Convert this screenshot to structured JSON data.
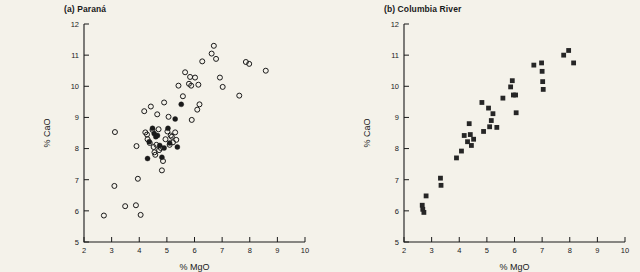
{
  "figure": {
    "background_color": "#f4f2ea",
    "marker_color": "#1a1a1a",
    "axis_color": "#1a1a1a"
  },
  "chart_data": [
    {
      "type": "scatter",
      "title": "(a) Paraná",
      "panel_label": "(a)",
      "panel_name": "Paraná",
      "xlabel": "% MgO",
      "ylabel": "% CaO",
      "xlim": [
        2,
        10
      ],
      "ylim": [
        5,
        12
      ],
      "xticks": [
        2,
        3,
        4,
        5,
        6,
        7,
        8,
        9,
        10
      ],
      "xtick_labels": [
        "2",
        "3",
        "4",
        "5",
        "6",
        "7",
        "8",
        "9",
        "10"
      ],
      "yticks": [
        5,
        6,
        7,
        8,
        9,
        10,
        11,
        12
      ],
      "ytick_labels": [
        "5",
        "6",
        "7",
        "8",
        "9",
        "10",
        "11",
        "12"
      ],
      "grid": false,
      "legend": null,
      "series": [
        {
          "name": "open-circles",
          "marker": "open-circle",
          "points": [
            [
              2.72,
              5.85
            ],
            [
              3.12,
              8.53
            ],
            [
              3.1,
              6.8
            ],
            [
              3.49,
              6.15
            ],
            [
              3.88,
              6.18
            ],
            [
              3.9,
              8.08
            ],
            [
              3.95,
              7.03
            ],
            [
              4.05,
              5.87
            ],
            [
              4.18,
              9.2
            ],
            [
              4.22,
              8.52
            ],
            [
              4.28,
              8.45
            ],
            [
              4.3,
              8.3
            ],
            [
              4.38,
              8.18
            ],
            [
              4.42,
              9.35
            ],
            [
              4.48,
              8.6
            ],
            [
              4.52,
              8.05
            ],
            [
              4.55,
              7.88
            ],
            [
              4.58,
              7.8
            ],
            [
              4.62,
              8.12
            ],
            [
              4.65,
              9.1
            ],
            [
              4.7,
              8.62
            ],
            [
              4.72,
              7.95
            ],
            [
              4.78,
              8.02
            ],
            [
              4.82,
              7.3
            ],
            [
              4.86,
              7.6
            ],
            [
              4.9,
              9.48
            ],
            [
              4.95,
              8.3
            ],
            [
              5.02,
              8.55
            ],
            [
              5.06,
              9.02
            ],
            [
              5.1,
              8.12
            ],
            [
              5.14,
              8.42
            ],
            [
              5.18,
              8.38
            ],
            [
              5.22,
              8.2
            ],
            [
              5.3,
              8.52
            ],
            [
              5.34,
              8.28
            ],
            [
              5.42,
              10.02
            ],
            [
              5.58,
              9.68
            ],
            [
              5.66,
              10.45
            ],
            [
              5.8,
              10.08
            ],
            [
              5.84,
              10.3
            ],
            [
              5.88,
              10.02
            ],
            [
              5.9,
              8.92
            ],
            [
              6.02,
              10.28
            ],
            [
              6.1,
              9.25
            ],
            [
              6.14,
              10.05
            ],
            [
              6.18,
              9.42
            ],
            [
              6.28,
              10.8
            ],
            [
              6.62,
              11.05
            ],
            [
              6.7,
              11.3
            ],
            [
              6.78,
              10.88
            ],
            [
              6.92,
              10.28
            ],
            [
              7.02,
              9.98
            ],
            [
              7.62,
              9.7
            ],
            [
              7.86,
              10.78
            ],
            [
              7.98,
              10.72
            ],
            [
              8.58,
              10.5
            ]
          ]
        },
        {
          "name": "filled-circles",
          "marker": "filled-circle",
          "points": [
            [
              4.3,
              7.68
            ],
            [
              4.36,
              8.22
            ],
            [
              4.48,
              8.65
            ],
            [
              4.54,
              8.48
            ],
            [
              4.6,
              8.38
            ],
            [
              4.66,
              8.42
            ],
            [
              4.74,
              8.1
            ],
            [
              4.82,
              7.72
            ],
            [
              4.9,
              8.02
            ],
            [
              5.04,
              8.65
            ],
            [
              5.1,
              8.18
            ],
            [
              5.3,
              8.95
            ],
            [
              5.38,
              8.05
            ],
            [
              5.52,
              9.42
            ]
          ]
        }
      ]
    },
    {
      "type": "scatter",
      "title": "(b) Columbia River",
      "panel_label": "(b)",
      "panel_name": "Columbia River",
      "xlabel": "% MgO",
      "ylabel": "% CaO",
      "xlim": [
        2,
        10
      ],
      "ylim": [
        5,
        12
      ],
      "xticks": [
        2,
        3,
        4,
        5,
        6,
        7,
        8,
        9,
        10
      ],
      "xtick_labels": [
        "2",
        "3",
        "4",
        "5",
        "6",
        "7",
        "8",
        "9",
        "10"
      ],
      "yticks": [
        5,
        6,
        7,
        8,
        9,
        10,
        11,
        12
      ],
      "ytick_labels": [
        "5",
        "6",
        "7",
        "8",
        "9",
        "10",
        "11",
        "12"
      ],
      "grid": false,
      "legend": null,
      "series": [
        {
          "name": "filled-squares",
          "marker": "filled-square",
          "points": [
            [
              2.66,
              6.18
            ],
            [
              2.68,
              6.05
            ],
            [
              2.72,
              5.95
            ],
            [
              2.8,
              6.48
            ],
            [
              3.32,
              7.05
            ],
            [
              3.34,
              6.82
            ],
            [
              3.9,
              7.7
            ],
            [
              4.08,
              7.92
            ],
            [
              4.18,
              8.42
            ],
            [
              4.3,
              8.22
            ],
            [
              4.36,
              8.8
            ],
            [
              4.4,
              8.45
            ],
            [
              4.44,
              8.1
            ],
            [
              4.52,
              8.3
            ],
            [
              4.82,
              9.48
            ],
            [
              4.88,
              8.55
            ],
            [
              5.06,
              9.3
            ],
            [
              5.1,
              8.7
            ],
            [
              5.16,
              8.9
            ],
            [
              5.22,
              9.12
            ],
            [
              5.36,
              8.68
            ],
            [
              5.58,
              9.62
            ],
            [
              5.86,
              9.98
            ],
            [
              5.92,
              10.18
            ],
            [
              5.96,
              9.72
            ],
            [
              6.04,
              9.72
            ],
            [
              6.06,
              9.15
            ],
            [
              6.7,
              10.68
            ],
            [
              6.98,
              10.75
            ],
            [
              7.0,
              10.48
            ],
            [
              7.02,
              10.15
            ],
            [
              7.04,
              9.9
            ],
            [
              7.78,
              11.0
            ],
            [
              7.96,
              11.15
            ],
            [
              8.14,
              10.75
            ]
          ]
        }
      ]
    }
  ]
}
